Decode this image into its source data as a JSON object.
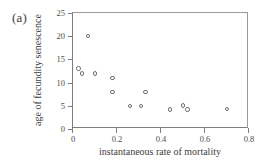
{
  "figure": {
    "panel_label": "(a)",
    "background_color": "#ffffff",
    "axis_color": "#7d7d7d",
    "marker_color": "#6f6f6f",
    "text_color": "#3d3d3d"
  },
  "chart_data": {
    "type": "scatter",
    "title": "",
    "xlabel": "instantaneous rate of mortality",
    "ylabel": "age of fecundity senescence",
    "xlim": [
      0,
      0.8
    ],
    "ylim": [
      0,
      25
    ],
    "xticks": [
      0,
      0.2,
      0.4,
      0.6,
      0.8
    ],
    "xtick_labels": [
      "0",
      "0.2",
      "0.4",
      "0.6",
      "0.8"
    ],
    "yticks": [
      0,
      5,
      10,
      15,
      20,
      25
    ],
    "ytick_labels": [
      "0",
      "5",
      "10",
      "15",
      "20",
      "25"
    ],
    "grid": false,
    "legend": null,
    "marker": "open-circle",
    "points": [
      {
        "x": 0.068,
        "y": 20.0
      },
      {
        "x": 0.025,
        "y": 13.0
      },
      {
        "x": 0.04,
        "y": 12.0
      },
      {
        "x": 0.1,
        "y": 12.0
      },
      {
        "x": 0.18,
        "y": 11.0
      },
      {
        "x": 0.18,
        "y": 8.0
      },
      {
        "x": 0.33,
        "y": 8.0
      },
      {
        "x": 0.26,
        "y": 5.0
      },
      {
        "x": 0.31,
        "y": 5.0
      },
      {
        "x": 0.5,
        "y": 5.1
      },
      {
        "x": 0.44,
        "y": 4.2
      },
      {
        "x": 0.52,
        "y": 4.2
      },
      {
        "x": 0.7,
        "y": 4.3
      }
    ]
  }
}
